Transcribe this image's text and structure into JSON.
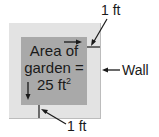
{
  "diagram": {
    "garden_label_line1": "Area of",
    "garden_label_line2": "garden =",
    "garden_label_line3": "25 ft",
    "garden_label_exp": "2",
    "top_dimension_label": "1 ft",
    "bottom_dimension_label": "1 ft",
    "wall_label": "Wall",
    "colors": {
      "wall": "#e3e3e3",
      "garden": "#a9a9a9",
      "lines": "#1a1a1a"
    }
  }
}
